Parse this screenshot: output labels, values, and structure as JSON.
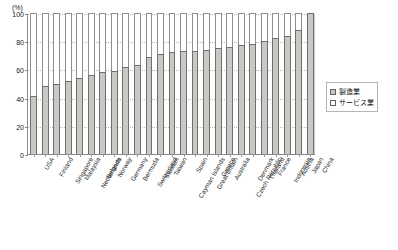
{
  "chart_data": {
    "type": "bar",
    "title": "",
    "subtitle": "",
    "xlabel": "",
    "ylabel": "",
    "unit_label": "(%)",
    "ylim": [
      0,
      100
    ],
    "yticks": [
      0,
      20,
      40,
      60,
      80,
      100
    ],
    "grid": true,
    "stacked": true,
    "legend_position": "right",
    "categories": [
      "USA",
      "Finland",
      "Singapore",
      "Malaysia",
      "Netherlands",
      "Belgium",
      "Norway",
      "Germany",
      "Bermuda",
      "Switzerland",
      "Sweden",
      "Taiwan",
      "Cayman Islands",
      "Spain",
      "Great Britain",
      "Greece",
      "Australia",
      "Czech Republic",
      "Denmark",
      "Thailand",
      "France",
      "Indonesia",
      "Austria",
      "Japan",
      "China"
    ],
    "series": [
      {
        "name": "製造業",
        "key": "manufacturing",
        "color": "#c9c9c4",
        "values": [
          41,
          48,
          50,
          52,
          54,
          56,
          58,
          59,
          62,
          63,
          69,
          71,
          72,
          73,
          73,
          74,
          75,
          76,
          77,
          78,
          80,
          82,
          84,
          88,
          100
        ]
      },
      {
        "name": "サービス業",
        "key": "services",
        "color": "#ffffff",
        "values": [
          100,
          100,
          100,
          100,
          100,
          100,
          100,
          100,
          100,
          100,
          100,
          100,
          100,
          100,
          100,
          100,
          100,
          100,
          100,
          100,
          100,
          100,
          100,
          100,
          100
        ]
      }
    ]
  },
  "legend": {
    "items": [
      {
        "label": "製造業"
      },
      {
        "label": "サービス業"
      }
    ]
  }
}
